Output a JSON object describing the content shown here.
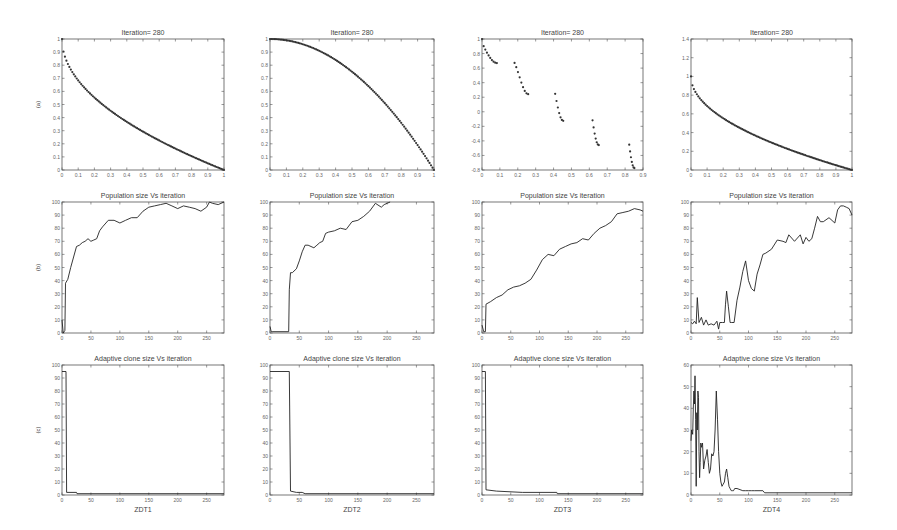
{
  "figure": {
    "row_labels": [
      "(a)",
      "(b)",
      "(c)"
    ],
    "column_labels": [
      "ZDT1",
      "ZDT2",
      "ZDT3",
      "ZDT4"
    ]
  },
  "chart_data": [
    {
      "id": "zdt1-front",
      "type": "scatter",
      "title": "Iteration= 280",
      "xlabel": "",
      "ylabel": "(a)",
      "xlim": [
        0,
        1
      ],
      "ylim": [
        0,
        1
      ],
      "xticks": [
        "0",
        "0.1",
        "0.2",
        "0.3",
        "0.4",
        "0.5",
        "0.6",
        "0.7",
        "0.8",
        "0.9",
        "1"
      ],
      "yticks": [
        "0",
        "0.1",
        "0.2",
        "0.3",
        "0.4",
        "0.5",
        "0.6",
        "0.7",
        "0.8",
        "0.9",
        "1"
      ],
      "function": "1-sqrt(x)",
      "x_range": [
        0,
        1
      ]
    },
    {
      "id": "zdt2-front",
      "type": "scatter",
      "title": "Iteration= 280",
      "xlabel": "",
      "ylabel": "",
      "xlim": [
        0,
        1
      ],
      "ylim": [
        0,
        1
      ],
      "xticks": [
        "0",
        "0.1",
        "0.2",
        "0.3",
        "0.4",
        "0.5",
        "0.6",
        "0.7",
        "0.8",
        "0.9",
        "1"
      ],
      "yticks": [
        "0",
        "0.1",
        "0.2",
        "0.3",
        "0.4",
        "0.5",
        "0.6",
        "0.7",
        "0.8",
        "0.9",
        "1"
      ],
      "function": "1-x^2",
      "x_range": [
        0,
        1
      ]
    },
    {
      "id": "zdt3-front",
      "type": "scatter",
      "title": "Iteration= 280",
      "xlabel": "",
      "ylabel": "",
      "xlim": [
        0,
        0.9
      ],
      "ylim": [
        -0.8,
        1
      ],
      "xticks": [
        "0",
        "0.1",
        "0.2",
        "0.3",
        "0.4",
        "0.5",
        "0.6",
        "0.7",
        "0.8",
        "0.9"
      ],
      "yticks": [
        "-0.8",
        "-0.6",
        "-0.4",
        "-0.2",
        "0",
        "0.2",
        "0.4",
        "0.6",
        "0.8",
        "1"
      ],
      "function": "1-sqrt(x)-x*sin(10*pi*x)",
      "segments": [
        [
          0,
          0.083
        ],
        [
          0.182,
          0.258
        ],
        [
          0.409,
          0.454
        ],
        [
          0.618,
          0.653
        ],
        [
          0.823,
          0.852
        ]
      ]
    },
    {
      "id": "zdt4-front",
      "type": "scatter",
      "title": "Iteration= 280",
      "xlabel": "",
      "ylabel": "",
      "xlim": [
        0,
        1
      ],
      "ylim": [
        0,
        1.4
      ],
      "xticks": [
        "0",
        "0.1",
        "0.2",
        "0.3",
        "0.4",
        "0.5",
        "0.6",
        "0.7",
        "0.8",
        "0.9",
        "1"
      ],
      "yticks": [
        "0",
        "0.2",
        "0.4",
        "0.6",
        "0.8",
        "1",
        "1.2",
        "1.4"
      ],
      "function": "1-sqrt(x)",
      "x_range": [
        0,
        1
      ]
    },
    {
      "id": "zdt1-population",
      "type": "line",
      "title": "Population size Vs iteration",
      "xlabel": "",
      "ylabel": "(b)",
      "xlim": [
        0,
        280
      ],
      "ylim": [
        0,
        100
      ],
      "xticks": [
        "0",
        "50",
        "100",
        "150",
        "200",
        "250"
      ],
      "yticks": [
        "0",
        "10",
        "20",
        "30",
        "40",
        "50",
        "60",
        "70",
        "80",
        "90",
        "100"
      ],
      "x": [
        0,
        2,
        5,
        6,
        10,
        15,
        20,
        25,
        30,
        35,
        40,
        45,
        50,
        55,
        60,
        65,
        70,
        80,
        90,
        100,
        110,
        120,
        130,
        140,
        150,
        160,
        170,
        180,
        190,
        200,
        210,
        220,
        230,
        240,
        250,
        255,
        260,
        270,
        280
      ],
      "values": [
        10,
        0,
        2,
        38,
        41,
        50,
        58,
        66,
        67,
        69,
        70,
        72,
        70,
        71,
        72,
        78,
        81,
        86,
        86,
        84,
        86,
        88,
        88,
        93,
        96,
        97,
        98,
        99,
        97,
        95,
        97,
        96,
        95,
        93,
        96,
        100,
        99,
        98,
        100
      ]
    },
    {
      "id": "zdt2-population",
      "type": "line",
      "title": "Population size Vs iteration",
      "xlabel": "",
      "ylabel": "",
      "xlim": [
        0,
        280
      ],
      "ylim": [
        0,
        100
      ],
      "xticks": [
        "0",
        "50",
        "100",
        "150",
        "200",
        "250"
      ],
      "yticks": [
        "0",
        "10",
        "20",
        "30",
        "40",
        "50",
        "60",
        "70",
        "80",
        "90",
        "100"
      ],
      "x": [
        0,
        2,
        5,
        32,
        33,
        35,
        38,
        45,
        50,
        55,
        60,
        65,
        70,
        75,
        80,
        85,
        90,
        95,
        100,
        110,
        120,
        130,
        140,
        150,
        160,
        170,
        180,
        190,
        195,
        200,
        205
      ],
      "values": [
        5,
        1,
        1,
        1,
        33,
        46,
        46,
        49,
        55,
        62,
        67,
        67,
        66,
        65,
        67,
        69,
        70,
        76,
        77,
        78,
        80,
        79,
        85,
        86,
        89,
        93,
        99,
        96,
        98,
        99,
        100
      ]
    },
    {
      "id": "zdt3-population",
      "type": "line",
      "title": "Population size Vs iteration",
      "xlabel": "",
      "ylabel": "",
      "xlim": [
        0,
        280
      ],
      "ylim": [
        0,
        100
      ],
      "xticks": [
        "0",
        "50",
        "100",
        "150",
        "200",
        "250"
      ],
      "yticks": [
        "0",
        "10",
        "20",
        "30",
        "40",
        "50",
        "60",
        "70",
        "80",
        "90",
        "100"
      ],
      "x": [
        0,
        3,
        6,
        7,
        15,
        25,
        35,
        45,
        55,
        65,
        75,
        85,
        95,
        105,
        115,
        125,
        135,
        145,
        155,
        165,
        175,
        185,
        195,
        205,
        215,
        225,
        235,
        245,
        255,
        265,
        275,
        280
      ],
      "values": [
        6,
        1,
        1,
        22,
        24,
        27,
        29,
        33,
        35,
        36,
        38,
        41,
        48,
        56,
        60,
        59,
        64,
        66,
        68,
        69,
        72,
        71,
        76,
        80,
        82,
        85,
        91,
        92,
        93,
        95,
        94,
        93
      ]
    },
    {
      "id": "zdt4-population",
      "type": "line",
      "title": "Population size Vs iteration",
      "xlabel": "",
      "ylabel": "",
      "xlim": [
        0,
        280
      ],
      "ylim": [
        0,
        100
      ],
      "xticks": [
        "0",
        "50",
        "100",
        "150",
        "200",
        "250"
      ],
      "yticks": [
        "0",
        "10",
        "20",
        "30",
        "40",
        "50",
        "60",
        "70",
        "80",
        "90",
        "100"
      ],
      "x": [
        0,
        3,
        6,
        9,
        11,
        14,
        18,
        22,
        26,
        30,
        35,
        40,
        45,
        48,
        50,
        55,
        58,
        60,
        62,
        65,
        68,
        70,
        75,
        80,
        85,
        90,
        95,
        100,
        105,
        110,
        115,
        120,
        125,
        130,
        140,
        150,
        160,
        165,
        170,
        180,
        190,
        195,
        200,
        205,
        210,
        215,
        220,
        225,
        230,
        240,
        250,
        255,
        260,
        265,
        270,
        275,
        280
      ],
      "values": [
        8,
        7,
        9,
        7,
        27,
        8,
        12,
        6,
        10,
        6,
        7,
        6,
        9,
        3,
        8,
        8,
        8,
        22,
        32,
        20,
        8,
        8,
        8,
        25,
        35,
        47,
        55,
        40,
        34,
        32,
        45,
        52,
        60,
        61,
        64,
        71,
        70,
        69,
        75,
        70,
        75,
        68,
        73,
        70,
        72,
        80,
        89,
        85,
        85,
        88,
        84,
        94,
        97,
        97,
        96,
        95,
        90
      ]
    },
    {
      "id": "zdt1-clone-size",
      "type": "line",
      "title": "Adaptive clone size Vs iteration",
      "xlabel": "ZDT1",
      "ylabel": "(c)",
      "xlim": [
        0,
        280
      ],
      "ylim": [
        0,
        100
      ],
      "xticks": [
        "0",
        "50",
        "100",
        "150",
        "200",
        "250"
      ],
      "yticks": [
        "0",
        "10",
        "20",
        "30",
        "40",
        "50",
        "60",
        "70",
        "80",
        "90",
        "100"
      ],
      "x": [
        0,
        7,
        8,
        25,
        26,
        280
      ],
      "values": [
        95,
        95,
        2,
        2,
        1,
        1
      ]
    },
    {
      "id": "zdt2-clone-size",
      "type": "line",
      "title": "Adaptive clone size Vs iteration",
      "xlabel": "ZDT2",
      "ylabel": "",
      "xlim": [
        0,
        280
      ],
      "ylim": [
        0,
        100
      ],
      "xticks": [
        "0",
        "50",
        "100",
        "150",
        "200",
        "250"
      ],
      "yticks": [
        "0",
        "10",
        "20",
        "30",
        "40",
        "50",
        "60",
        "70",
        "80",
        "90",
        "100"
      ],
      "x": [
        0,
        33,
        35,
        45,
        55,
        60,
        280
      ],
      "values": [
        95,
        95,
        3,
        2,
        2,
        1,
        1
      ]
    },
    {
      "id": "zdt3-clone-size",
      "type": "line",
      "title": "Adaptive clone size Vs iteration",
      "xlabel": "ZDT3",
      "ylabel": "",
      "xlim": [
        0,
        280
      ],
      "ylim": [
        0,
        100
      ],
      "xticks": [
        "0",
        "50",
        "100",
        "150",
        "200",
        "250"
      ],
      "yticks": [
        "0",
        "10",
        "20",
        "30",
        "40",
        "50",
        "60",
        "70",
        "80",
        "90",
        "100"
      ],
      "x": [
        0,
        6,
        7,
        25,
        70,
        130,
        131,
        280
      ],
      "values": [
        95,
        95,
        4,
        3,
        2,
        2,
        1,
        1
      ]
    },
    {
      "id": "zdt4-clone-size",
      "type": "line",
      "title": "Adaptive clone size Vs iteration",
      "xlabel": "ZDT4",
      "ylabel": "",
      "xlim": [
        0,
        280
      ],
      "ylim": [
        0,
        60
      ],
      "xticks": [
        "0",
        "50",
        "100",
        "150",
        "200",
        "250"
      ],
      "yticks": [
        "0",
        "10",
        "20",
        "30",
        "40",
        "50",
        "60"
      ],
      "x": [
        0,
        1,
        3,
        4,
        5,
        6,
        7,
        8,
        9,
        10,
        11,
        12,
        13,
        14,
        15,
        16,
        17,
        18,
        20,
        22,
        24,
        26,
        28,
        30,
        32,
        34,
        36,
        38,
        40,
        42,
        44,
        46,
        48,
        50,
        52,
        54,
        56,
        58,
        60,
        62,
        64,
        66,
        68,
        70,
        72,
        74,
        76,
        80,
        90,
        95,
        100,
        105,
        110,
        125,
        128,
        280
      ],
      "values": [
        25,
        30,
        28,
        40,
        48,
        42,
        55,
        35,
        4,
        38,
        30,
        48,
        45,
        20,
        8,
        15,
        24,
        22,
        24,
        12,
        16,
        18,
        21,
        15,
        10,
        12,
        19,
        18,
        20,
        30,
        48,
        35,
        20,
        10,
        6,
        4,
        5,
        6,
        10,
        12,
        8,
        4,
        3,
        2,
        2,
        2,
        3,
        3,
        2,
        2,
        2,
        2,
        2,
        2,
        1,
        1
      ]
    }
  ]
}
